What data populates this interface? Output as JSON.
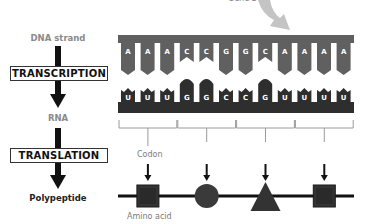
{
  "gene_label": "Gene 3",
  "left_column": {
    "dna_label": "DNA strand",
    "transcription_label": "TRANSCRIPTION",
    "rna_label": "RNA",
    "translation_label": "TRANSLATION",
    "polypeptide_label": "Polypeptide"
  },
  "dna_bases": [
    "A",
    "A",
    "A",
    "C",
    "C",
    "G",
    "G",
    "C",
    "A",
    "A",
    "A",
    "A"
  ],
  "rna_bases": [
    "U",
    "U",
    "U",
    "G",
    "G",
    "C",
    "C",
    "G",
    "U",
    "U",
    "U",
    "U"
  ],
  "codons": [
    "UUU",
    "GGC",
    "CGU",
    "UUU"
  ],
  "codon_label": "Codon",
  "amino_acid_label": "Amino acid",
  "amino_acid_shapes": [
    "square",
    "circle",
    "triangle",
    "square"
  ],
  "colors": {
    "dna": "#606060",
    "rna": "#2e2e2e",
    "arrow_light": "#bfbfbf",
    "text_gray": "#8a8a8a"
  }
}
